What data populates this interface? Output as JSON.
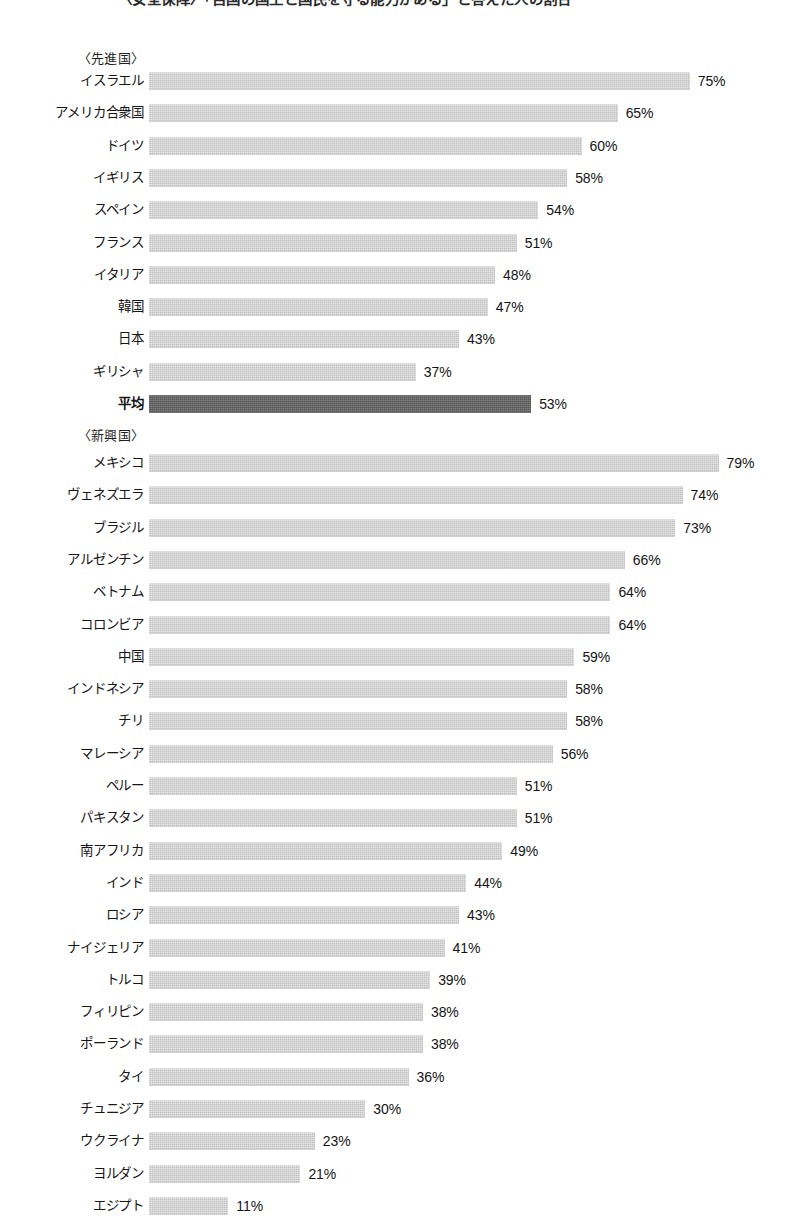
{
  "title": "〈安全保障〉「自国の国土と国民を守る能力がある」と答えた人の割合",
  "colors": {
    "bar": "#c2c2c2",
    "average_bar": "#565656",
    "text": "#161616",
    "page_background": "#ffffff"
  },
  "chart_data": {
    "type": "bar",
    "orientation": "horizontal",
    "title": "〈安全保障〉「自国の国土と国民を守る能力がある」と答えた人の割合",
    "xlabel": "",
    "ylabel": "",
    "xlim": [
      0,
      79
    ],
    "grid": false,
    "legend": false,
    "value_suffix": "%",
    "sections": [
      {
        "name": "developed",
        "header": "〈先進国〉",
        "categories": [
          "イスラエル",
          "アメリカ合衆国",
          "ドイツ",
          "イギリス",
          "スペイン",
          "フランス",
          "イタリア",
          "韓国",
          "日本",
          "ギリシャ",
          "平均"
        ],
        "values": [
          75,
          65,
          60,
          58,
          54,
          51,
          48,
          47,
          43,
          37,
          53
        ],
        "average_index": 10
      },
      {
        "name": "emerging",
        "header": "〈新興国〉",
        "categories": [
          "メキシコ",
          "ヴェネズエラ",
          "ブラジル",
          "アルゼンチン",
          "ベトナム",
          "コロンビア",
          "中国",
          "インドネシア",
          "チリ",
          "マレーシア",
          "ペルー",
          "パキスタン",
          "南アフリカ",
          "インド",
          "ロシア",
          "ナイジェリア",
          "トルコ",
          "フィリピン",
          "ポーランド",
          "タイ",
          "チュニジア",
          "ウクライナ",
          "ヨルダン",
          "エジプト",
          "平均"
        ],
        "values": [
          79,
          74,
          73,
          66,
          64,
          64,
          59,
          58,
          58,
          56,
          51,
          51,
          49,
          44,
          43,
          41,
          39,
          38,
          38,
          36,
          30,
          23,
          21,
          11,
          50
        ],
        "average_index": 24
      }
    ]
  },
  "sections": [
    {
      "header": "〈先進国〉",
      "rows": [
        {
          "label": "イスラエル",
          "value": 75,
          "value_label": "75%",
          "is_average": false
        },
        {
          "label": "アメリカ合衆国",
          "value": 65,
          "value_label": "65%",
          "is_average": false
        },
        {
          "label": "ドイツ",
          "value": 60,
          "value_label": "60%",
          "is_average": false
        },
        {
          "label": "イギリス",
          "value": 58,
          "value_label": "58%",
          "is_average": false
        },
        {
          "label": "スペイン",
          "value": 54,
          "value_label": "54%",
          "is_average": false
        },
        {
          "label": "フランス",
          "value": 51,
          "value_label": "51%",
          "is_average": false
        },
        {
          "label": "イタリア",
          "value": 48,
          "value_label": "48%",
          "is_average": false
        },
        {
          "label": "韓国",
          "value": 47,
          "value_label": "47%",
          "is_average": false
        },
        {
          "label": "日本",
          "value": 43,
          "value_label": "43%",
          "is_average": false
        },
        {
          "label": "ギリシャ",
          "value": 37,
          "value_label": "37%",
          "is_average": false
        },
        {
          "label": "平均",
          "value": 53,
          "value_label": "53%",
          "is_average": true
        }
      ]
    },
    {
      "header": "〈新興国〉",
      "rows": [
        {
          "label": "メキシコ",
          "value": 79,
          "value_label": "79%",
          "is_average": false
        },
        {
          "label": "ヴェネズエラ",
          "value": 74,
          "value_label": "74%",
          "is_average": false
        },
        {
          "label": "ブラジル",
          "value": 73,
          "value_label": "73%",
          "is_average": false
        },
        {
          "label": "アルゼンチン",
          "value": 66,
          "value_label": "66%",
          "is_average": false
        },
        {
          "label": "ベトナム",
          "value": 64,
          "value_label": "64%",
          "is_average": false
        },
        {
          "label": "コロンビア",
          "value": 64,
          "value_label": "64%",
          "is_average": false
        },
        {
          "label": "中国",
          "value": 59,
          "value_label": "59%",
          "is_average": false
        },
        {
          "label": "インドネシア",
          "value": 58,
          "value_label": "58%",
          "is_average": false
        },
        {
          "label": "チリ",
          "value": 58,
          "value_label": "58%",
          "is_average": false
        },
        {
          "label": "マレーシア",
          "value": 56,
          "value_label": "56%",
          "is_average": false
        },
        {
          "label": "ペルー",
          "value": 51,
          "value_label": "51%",
          "is_average": false
        },
        {
          "label": "パキスタン",
          "value": 51,
          "value_label": "51%",
          "is_average": false
        },
        {
          "label": "南アフリカ",
          "value": 49,
          "value_label": "49%",
          "is_average": false
        },
        {
          "label": "インド",
          "value": 44,
          "value_label": "44%",
          "is_average": false
        },
        {
          "label": "ロシア",
          "value": 43,
          "value_label": "43%",
          "is_average": false
        },
        {
          "label": "ナイジェリア",
          "value": 41,
          "value_label": "41%",
          "is_average": false
        },
        {
          "label": "トルコ",
          "value": 39,
          "value_label": "39%",
          "is_average": false
        },
        {
          "label": "フィリピン",
          "value": 38,
          "value_label": "38%",
          "is_average": false
        },
        {
          "label": "ポーランド",
          "value": 38,
          "value_label": "38%",
          "is_average": false
        },
        {
          "label": "タイ",
          "value": 36,
          "value_label": "36%",
          "is_average": false
        },
        {
          "label": "チュニジア",
          "value": 30,
          "value_label": "30%",
          "is_average": false
        },
        {
          "label": "ウクライナ",
          "value": 23,
          "value_label": "23%",
          "is_average": false
        },
        {
          "label": "ヨルダン",
          "value": 21,
          "value_label": "21%",
          "is_average": false
        },
        {
          "label": "エジプト",
          "value": 11,
          "value_label": "11%",
          "is_average": false
        },
        {
          "label": "平均",
          "value": 50,
          "value_label": "50%",
          "is_average": true
        }
      ]
    }
  ]
}
